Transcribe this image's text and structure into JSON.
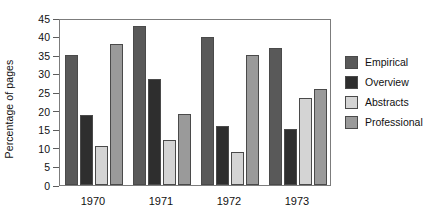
{
  "chart_data": {
    "type": "bar",
    "title": "",
    "subtitle": "",
    "xlabel": "",
    "ylabel": "Percentage of pages",
    "categories": [
      "1970",
      "1971",
      "1972",
      "1973"
    ],
    "series": [
      {
        "name": "Empirical",
        "color": "#595959",
        "values": [
          35,
          42.8,
          40,
          37
        ]
      },
      {
        "name": "Overview",
        "color": "#2e2e2e",
        "values": [
          19,
          28.5,
          16,
          15
        ]
      },
      {
        "name": "Abstracts",
        "color": "#d4d4d4",
        "values": [
          10.5,
          12,
          9,
          23.5
        ]
      },
      {
        "name": "Professional",
        "color": "#9a9a9a",
        "values": [
          38,
          19.2,
          35,
          26
        ]
      }
    ],
    "ylim": [
      0,
      45
    ],
    "ytick_step": 5,
    "yticks": [
      "45",
      "40",
      "35",
      "30",
      "25",
      "20",
      "15",
      "10",
      "5",
      "0"
    ],
    "grid": false,
    "legend_position": "right"
  },
  "legend": {
    "items": [
      {
        "label": "Empirical"
      },
      {
        "label": "Overview"
      },
      {
        "label": "Abstracts"
      },
      {
        "label": "Professional"
      }
    ]
  }
}
